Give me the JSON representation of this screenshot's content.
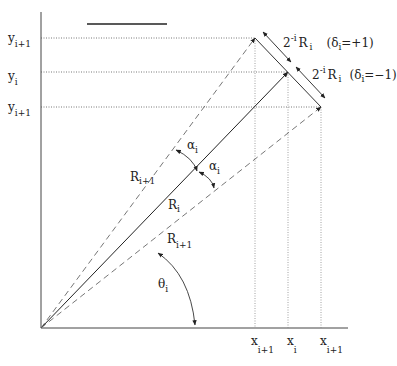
{
  "title_bar_decoration": "overline",
  "axes": {
    "y_labels": [
      {
        "main": "y",
        "sub": "i+1",
        "y": 42
      },
      {
        "main": "y",
        "sub": "i",
        "y": 76
      },
      {
        "main": "y",
        "sub": "i+1",
        "y": 110
      }
    ],
    "x_labels": [
      {
        "main": "x",
        "sub": "i+1",
        "x": 255
      },
      {
        "main": "x",
        "sub": "i",
        "x": 288
      },
      {
        "main": "x",
        "sub": "i+1",
        "x": 321
      }
    ]
  },
  "vectors": {
    "r_upper": {
      "main": "R",
      "sub": "i+1"
    },
    "r_main": {
      "main": "R",
      "sub": "i"
    },
    "r_lower": {
      "main": "R",
      "sub": "i+1"
    }
  },
  "angles": {
    "alpha_upper": {
      "main": "α",
      "sub": "i"
    },
    "alpha_lower": {
      "main": "α",
      "sub": "i"
    },
    "theta": {
      "main": "θ",
      "sub": "i"
    }
  },
  "rotation_segments": {
    "upper": {
      "coef": "2",
      "exp": "-i",
      "var": "R",
      "sub": "i",
      "condition_prefix": "(δ",
      "condition_sub": "i",
      "condition_suffix": "=+1)"
    },
    "lower": {
      "coef": "2",
      "exp": "-i",
      "var": "R",
      "sub": "i",
      "condition_prefix": "(δ",
      "condition_sub": "i",
      "condition_suffix": "=−1)"
    }
  }
}
